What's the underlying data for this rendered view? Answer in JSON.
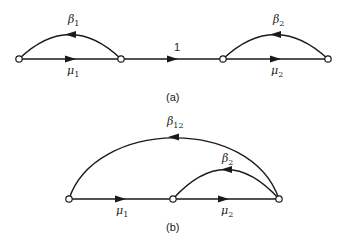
{
  "diagram_a": {
    "caption": "(a)",
    "nodes": [
      {
        "id": "a1",
        "x": 19,
        "y": 59
      },
      {
        "id": "a2",
        "x": 121,
        "y": 59
      },
      {
        "id": "a3",
        "x": 223,
        "y": 59
      },
      {
        "id": "a4",
        "x": 328,
        "y": 59
      }
    ],
    "edges": [
      {
        "from": "a1",
        "to": "a2",
        "type": "straight",
        "label": "μ",
        "sub": "1"
      },
      {
        "from": "a2",
        "to": "a1",
        "type": "arc",
        "label": "β",
        "sub": "1"
      },
      {
        "from": "a2",
        "to": "a3",
        "type": "straight",
        "label": "1",
        "sub": ""
      },
      {
        "from": "a3",
        "to": "a4",
        "type": "straight",
        "label": "μ",
        "sub": "2"
      },
      {
        "from": "a4",
        "to": "a3",
        "type": "arc",
        "label": "β",
        "sub": "2"
      }
    ]
  },
  "diagram_b": {
    "caption": "(b)",
    "nodes": [
      {
        "id": "b1",
        "x": 69,
        "y": 199
      },
      {
        "id": "b2",
        "x": 173,
        "y": 199
      },
      {
        "id": "b3",
        "x": 279,
        "y": 199
      }
    ],
    "edges": [
      {
        "from": "b1",
        "to": "b2",
        "type": "straight",
        "label": "μ",
        "sub": "1"
      },
      {
        "from": "b2",
        "to": "b3",
        "type": "straight",
        "label": "μ",
        "sub": "2"
      },
      {
        "from": "b3",
        "to": "b2",
        "type": "arc",
        "label": "β",
        "sub": "2"
      },
      {
        "from": "b3",
        "to": "b1",
        "type": "arc",
        "label": "β",
        "sub": "12"
      }
    ]
  },
  "labels": {
    "beta": "β",
    "mu": "μ",
    "one": "1",
    "s1": "1",
    "s2": "2",
    "s12": "12"
  }
}
